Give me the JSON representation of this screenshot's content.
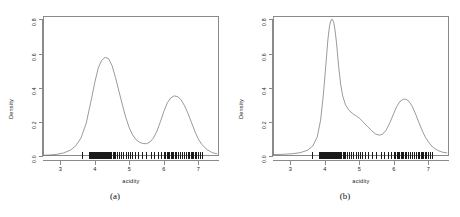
{
  "figure": {
    "panels": [
      {
        "caption": "(a)",
        "xlabel": "acidity",
        "ylabel": "Density",
        "xticks": [
          "3",
          "4",
          "5",
          "6",
          "7"
        ],
        "yticks": [
          "0.0",
          "0.2",
          "0.4",
          "0.6",
          "0.8"
        ]
      },
      {
        "caption": "(b)",
        "xlabel": "acidity",
        "ylabel": "Density",
        "xticks": [
          "3",
          "4",
          "5",
          "6",
          "7"
        ],
        "yticks": [
          "0.0",
          "0.2",
          "0.4",
          "0.6",
          "0.8"
        ]
      }
    ]
  },
  "chart_data": [
    {
      "type": "line",
      "title": "(a)",
      "xlabel": "acidity",
      "ylabel": "Density",
      "xlim": [
        2.5,
        7.6
      ],
      "ylim": [
        0.0,
        0.82
      ],
      "xticks": [
        3,
        4,
        5,
        6,
        7
      ],
      "yticks": [
        0.0,
        0.2,
        0.4,
        0.6,
        0.8
      ],
      "grid": false,
      "legend": null,
      "series": [
        {
          "name": "kernel density estimate",
          "x": [
            2.5,
            2.7,
            2.9,
            3.1,
            3.3,
            3.45,
            3.6,
            3.75,
            3.9,
            4.0,
            4.1,
            4.2,
            4.3,
            4.4,
            4.5,
            4.6,
            4.7,
            4.8,
            4.9,
            5.0,
            5.1,
            5.2,
            5.3,
            5.4,
            5.5,
            5.6,
            5.7,
            5.8,
            5.9,
            6.0,
            6.1,
            6.2,
            6.3,
            6.4,
            6.5,
            6.6,
            6.7,
            6.8,
            6.9,
            7.0,
            7.1,
            7.25,
            7.4,
            7.55
          ],
          "y": [
            0.004,
            0.006,
            0.01,
            0.018,
            0.035,
            0.06,
            0.105,
            0.19,
            0.33,
            0.43,
            0.515,
            0.56,
            0.578,
            0.57,
            0.53,
            0.46,
            0.38,
            0.3,
            0.225,
            0.165,
            0.122,
            0.095,
            0.08,
            0.073,
            0.072,
            0.082,
            0.105,
            0.145,
            0.2,
            0.26,
            0.31,
            0.34,
            0.352,
            0.348,
            0.33,
            0.295,
            0.25,
            0.198,
            0.145,
            0.1,
            0.068,
            0.038,
            0.02,
            0.012
          ]
        }
      ],
      "rug": {
        "name": "acidity observations",
        "values": [
          3.62,
          3.82,
          3.84,
          3.86,
          3.88,
          3.9,
          3.93,
          3.96,
          3.99,
          4.02,
          4.04,
          4.06,
          4.08,
          4.1,
          4.11,
          4.12,
          4.13,
          4.14,
          4.15,
          4.16,
          4.17,
          4.18,
          4.19,
          4.2,
          4.21,
          4.22,
          4.23,
          4.24,
          4.25,
          4.26,
          4.27,
          4.28,
          4.29,
          4.3,
          4.31,
          4.32,
          4.33,
          4.34,
          4.35,
          4.36,
          4.38,
          4.4,
          4.42,
          4.45,
          4.48,
          4.52,
          4.56,
          4.6,
          4.64,
          4.7,
          4.76,
          4.82,
          4.9,
          4.96,
          5.02,
          5.08,
          5.18,
          5.26,
          5.36,
          5.48,
          5.62,
          5.72,
          5.84,
          5.92,
          6.0,
          6.04,
          6.08,
          6.12,
          6.16,
          6.2,
          6.24,
          6.28,
          6.32,
          6.36,
          6.4,
          6.46,
          6.52,
          6.58,
          6.64,
          6.7,
          6.74,
          6.78,
          6.82,
          6.86,
          6.9,
          6.94,
          7.0,
          7.06,
          7.12
        ]
      }
    },
    {
      "type": "line",
      "title": "(b)",
      "xlabel": "acidity",
      "ylabel": "Density",
      "xlim": [
        2.5,
        7.6
      ],
      "ylim": [
        0.0,
        0.82
      ],
      "xticks": [
        3,
        4,
        5,
        6,
        7
      ],
      "yticks": [
        0.0,
        0.2,
        0.4,
        0.6,
        0.8
      ],
      "grid": false,
      "legend": null,
      "series": [
        {
          "name": "kernel density estimate",
          "x": [
            2.5,
            2.8,
            3.05,
            3.3,
            3.5,
            3.65,
            3.78,
            3.88,
            3.96,
            4.03,
            4.09,
            4.14,
            4.18,
            4.22,
            4.26,
            4.3,
            4.34,
            4.4,
            4.46,
            4.52,
            4.6,
            4.7,
            4.8,
            4.9,
            5.0,
            5.12,
            5.24,
            5.36,
            5.48,
            5.58,
            5.68,
            5.78,
            5.88,
            5.98,
            6.08,
            6.18,
            6.28,
            6.36,
            6.44,
            6.52,
            6.62,
            6.72,
            6.82,
            6.92,
            7.02,
            7.14,
            7.28,
            7.42,
            7.55
          ],
          "y": [
            0.008,
            0.01,
            0.013,
            0.02,
            0.034,
            0.058,
            0.11,
            0.21,
            0.36,
            0.53,
            0.68,
            0.765,
            0.796,
            0.8,
            0.782,
            0.735,
            0.662,
            0.53,
            0.42,
            0.352,
            0.3,
            0.268,
            0.25,
            0.236,
            0.222,
            0.198,
            0.172,
            0.148,
            0.128,
            0.122,
            0.128,
            0.152,
            0.192,
            0.24,
            0.288,
            0.32,
            0.333,
            0.332,
            0.32,
            0.296,
            0.252,
            0.2,
            0.15,
            0.108,
            0.078,
            0.05,
            0.032,
            0.022,
            0.018
          ]
        }
      ],
      "rug": {
        "name": "acidity observations",
        "values": [
          3.62,
          3.82,
          3.84,
          3.86,
          3.88,
          3.9,
          3.93,
          3.96,
          3.99,
          4.02,
          4.04,
          4.06,
          4.08,
          4.1,
          4.11,
          4.12,
          4.13,
          4.14,
          4.15,
          4.16,
          4.17,
          4.18,
          4.19,
          4.2,
          4.21,
          4.22,
          4.23,
          4.24,
          4.25,
          4.26,
          4.27,
          4.28,
          4.29,
          4.3,
          4.31,
          4.32,
          4.33,
          4.34,
          4.35,
          4.36,
          4.38,
          4.4,
          4.42,
          4.45,
          4.48,
          4.52,
          4.56,
          4.6,
          4.64,
          4.7,
          4.76,
          4.82,
          4.9,
          4.96,
          5.02,
          5.08,
          5.18,
          5.26,
          5.36,
          5.48,
          5.62,
          5.72,
          5.84,
          5.92,
          6.0,
          6.04,
          6.08,
          6.12,
          6.16,
          6.2,
          6.24,
          6.28,
          6.32,
          6.36,
          6.4,
          6.46,
          6.52,
          6.58,
          6.64,
          6.7,
          6.74,
          6.78,
          6.82,
          6.86,
          6.9,
          6.94,
          7.0,
          7.06,
          7.12
        ]
      }
    }
  ]
}
